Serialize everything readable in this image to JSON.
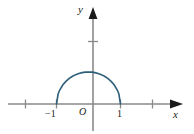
{
  "figure": {
    "title": "",
    "background_color": "#ffffff",
    "width": 194,
    "height": 134
  },
  "axes": {
    "x_axis_label": "x",
    "y_axis_label": "y",
    "origin_label": "O",
    "axis_color": "#8a8a8a",
    "label_color": "#1a1a1a"
  },
  "tick_labels": {
    "x_neg_one": "−1",
    "x_pos_one": "1"
  },
  "curve": {
    "color": "#2d5f7a",
    "stroke_width": 1.6,
    "description": "upper semicircle"
  },
  "chart_data": {
    "type": "line",
    "title": "",
    "xlabel": "x",
    "ylabel": "y",
    "grid": false,
    "legend": null,
    "xlim": [
      -2.6,
      2.8
    ],
    "ylim": [
      -0.9,
      2.9
    ],
    "xticks": [
      -2,
      -1,
      1,
      2
    ],
    "xticklabels": [
      "",
      "−1",
      "1",
      ""
    ],
    "yticks": [
      2
    ],
    "yticklabels": [
      ""
    ],
    "annotations": [
      {
        "text": "O",
        "x": -0.18,
        "y": -0.25
      },
      {
        "text": "−1",
        "x": -1.12,
        "y": -0.3
      },
      {
        "text": "1",
        "x": 0.92,
        "y": -0.3
      },
      {
        "text": "y",
        "x": -0.18,
        "y": 2.72
      },
      {
        "text": "x",
        "x": 2.62,
        "y": -0.32
      }
    ],
    "series": [
      {
        "name": "y = sqrt(1 - x^2)",
        "color": "#2d5f7a",
        "x": [
          -1.0,
          -0.95,
          -0.9,
          -0.8,
          -0.7,
          -0.6,
          -0.5,
          -0.4,
          -0.3,
          -0.2,
          -0.1,
          0.0,
          0.1,
          0.2,
          0.3,
          0.4,
          0.5,
          0.6,
          0.7,
          0.8,
          0.9,
          0.95,
          1.0
        ],
        "y": [
          0.0,
          0.312,
          0.436,
          0.6,
          0.714,
          0.8,
          0.866,
          0.917,
          0.954,
          0.98,
          0.995,
          1.0,
          0.995,
          0.98,
          0.954,
          0.917,
          0.866,
          0.8,
          0.714,
          0.6,
          0.436,
          0.312,
          0.0
        ]
      }
    ]
  }
}
